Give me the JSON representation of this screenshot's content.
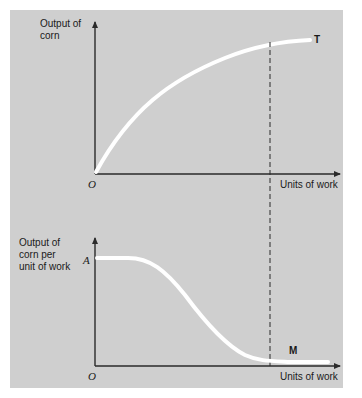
{
  "colors": {
    "background": "#cfcfcf",
    "axis": "#2a2a2a",
    "curve": "#ffffff",
    "dashed_guide": "#2a2a2a",
    "text": "#1a1a1a"
  },
  "top_graph": {
    "y_axis_label_line1": "Output of",
    "y_axis_label_line2": "corn",
    "x_axis_label": "Units of work",
    "origin_label": "O",
    "curve_label": "T",
    "curve_description": "Total product curve rising at a diminishing rate"
  },
  "bottom_graph": {
    "y_axis_label_line1": "Output of",
    "y_axis_label_line2": "corn per",
    "y_axis_label_line3": "unit of work",
    "y_intercept_label": "A",
    "x_axis_label": "Units of work",
    "origin_label": "O",
    "curve_label": "M",
    "curve_description": "Marginal product: flat at A, then declining in S-shape toward near zero"
  },
  "guide_line": {
    "style": "dashed",
    "description": "Vertical dashed line spanning both graphs at the same units of work"
  }
}
